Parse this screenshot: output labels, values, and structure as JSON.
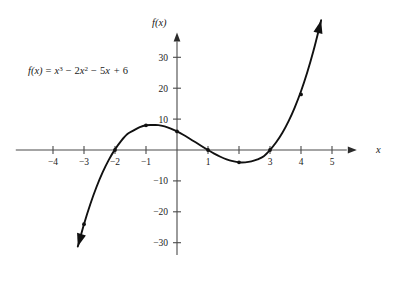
{
  "figure": {
    "background_color": "#ffffff",
    "curve_color": "#111111",
    "axis_color": "#4a4a4a",
    "equation_text": "f(x) = x³ − 2x² − 5x + 6",
    "equation_parts": {
      "fx": "f(x)",
      "equals": "=",
      "term1_base": "x",
      "term1_exp": "3",
      "minus1": "−",
      "term2_coef": "2",
      "term2_base": "x",
      "term2_exp": "2",
      "minus2": "−",
      "term3_coef": "5",
      "term3_base": "x",
      "plus": "+",
      "constant": "6"
    },
    "x_axis_name": "x",
    "y_axis_name": "f(x)"
  },
  "chart_data": {
    "type": "line",
    "title": "",
    "subtitle": "",
    "function": "f(x) = x^3 - 2x^2 - 5x + 6",
    "xlabel": "x",
    "ylabel": "f(x)",
    "xlim": [
      -5.2,
      5.8
    ],
    "ylim": [
      -34,
      38
    ],
    "grid": false,
    "legend": null,
    "x_ticks": [
      -4,
      -3,
      -2,
      -1,
      1,
      2,
      3,
      4,
      5
    ],
    "x_tick_labels": [
      "−4",
      "−3",
      "−2",
      "−1",
      "1",
      "2",
      "3",
      "4",
      "5"
    ],
    "y_ticks": [
      -30,
      -20,
      -10,
      10,
      20,
      30
    ],
    "y_tick_labels": [
      "−30",
      "−20",
      "−10",
      "10",
      "20",
      "30"
    ],
    "x_tick_labels_hidden": [
      "2"
    ],
    "series": [
      {
        "name": "f(x) = x^3 - 2x^2 - 5x + 6",
        "x": [
          -3.2,
          -3.0,
          -2.8,
          -2.6,
          -2.4,
          -2.2,
          -2.0,
          -1.8,
          -1.6,
          -1.4,
          -1.2,
          -1.0,
          -0.8,
          -0.6,
          -0.4,
          -0.2,
          0.0,
          0.2,
          0.4,
          0.6,
          0.8,
          1.0,
          1.2,
          1.4,
          1.6,
          1.8,
          2.0,
          2.2,
          2.4,
          2.6,
          2.8,
          3.0,
          3.2,
          3.4,
          3.6,
          3.8,
          4.0,
          4.2,
          4.4,
          4.6,
          4.65
        ],
        "y": [
          -31.25,
          -24.0,
          -17.63,
          -12.06,
          -7.26,
          -3.19,
          0.2,
          2.98,
          5.18,
          6.34,
          7.39,
          8.0,
          8.08,
          8.06,
          7.62,
          6.91,
          6.0,
          4.93,
          3.74,
          2.5,
          1.23,
          0.0,
          -1.15,
          -2.18,
          -3.02,
          -3.62,
          -4.0,
          -3.99,
          -3.7,
          -3.06,
          -2.03,
          0.0,
          2.49,
          5.58,
          9.34,
          13.83,
          19.0,
          25.06,
          32.02,
          39.93,
          42.0
        ],
        "marker_points": [
          {
            "x": -3,
            "y": -24
          },
          {
            "x": -2,
            "y": 0
          },
          {
            "x": -1,
            "y": 8
          },
          {
            "x": 0,
            "y": 6
          },
          {
            "x": 1,
            "y": 0
          },
          {
            "x": 2,
            "y": -4
          },
          {
            "x": 3,
            "y": 0
          },
          {
            "x": 4,
            "y": 18
          }
        ],
        "roots": [
          -2,
          1,
          3
        ],
        "local_max": {
          "x": -1,
          "y": 8
        },
        "local_min": {
          "x": 2,
          "y": -4
        },
        "y_intercept": 6,
        "end_arrows": [
          "start",
          "end"
        ]
      }
    ]
  }
}
